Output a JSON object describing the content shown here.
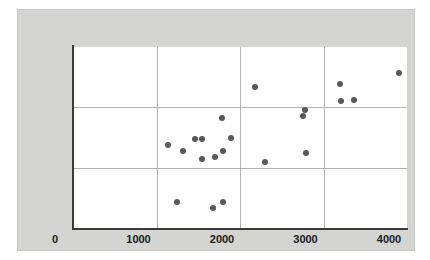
{
  "chart_data": {
    "type": "scatter",
    "title": "",
    "subtitle": "",
    "xlabel": "",
    "ylabel": "",
    "xlim": [
      0,
      4000
    ],
    "ylim": [
      0,
      300
    ],
    "xticks": [
      0,
      1000,
      2000,
      3000,
      4000
    ],
    "yticks": [
      0,
      100,
      200,
      300
    ],
    "xtick_labels": [
      "0",
      "1000",
      "2000",
      "3000",
      "4000"
    ],
    "ytick_labels": [
      "0",
      "100",
      "200",
      "300"
    ],
    "grid": true,
    "grid_color": "#b2b2b2",
    "legend": null,
    "legend_position": "none",
    "marker_color": "#585858",
    "marker_size": 6,
    "plot_background": "#ffffff",
    "figure_background": "#d4d4d2",
    "axis_color": "#3a3a3a",
    "n_points": 22,
    "points": [
      {
        "x": 1140,
        "y": 138
      },
      {
        "x": 1245,
        "y": 43
      },
      {
        "x": 1320,
        "y": 127
      },
      {
        "x": 1460,
        "y": 147
      },
      {
        "x": 1545,
        "y": 147
      },
      {
        "x": 1545,
        "y": 115
      },
      {
        "x": 1680,
        "y": 33
      },
      {
        "x": 1700,
        "y": 118
      },
      {
        "x": 1790,
        "y": 183
      },
      {
        "x": 1795,
        "y": 127
      },
      {
        "x": 1800,
        "y": 43
      },
      {
        "x": 1890,
        "y": 150
      },
      {
        "x": 2185,
        "y": 233
      },
      {
        "x": 2300,
        "y": 110
      },
      {
        "x": 2760,
        "y": 185
      },
      {
        "x": 2775,
        "y": 196
      },
      {
        "x": 2790,
        "y": 124
      },
      {
        "x": 3200,
        "y": 238
      },
      {
        "x": 3205,
        "y": 210
      },
      {
        "x": 3370,
        "y": 212
      },
      {
        "x": 3900,
        "y": 257
      }
    ]
  }
}
